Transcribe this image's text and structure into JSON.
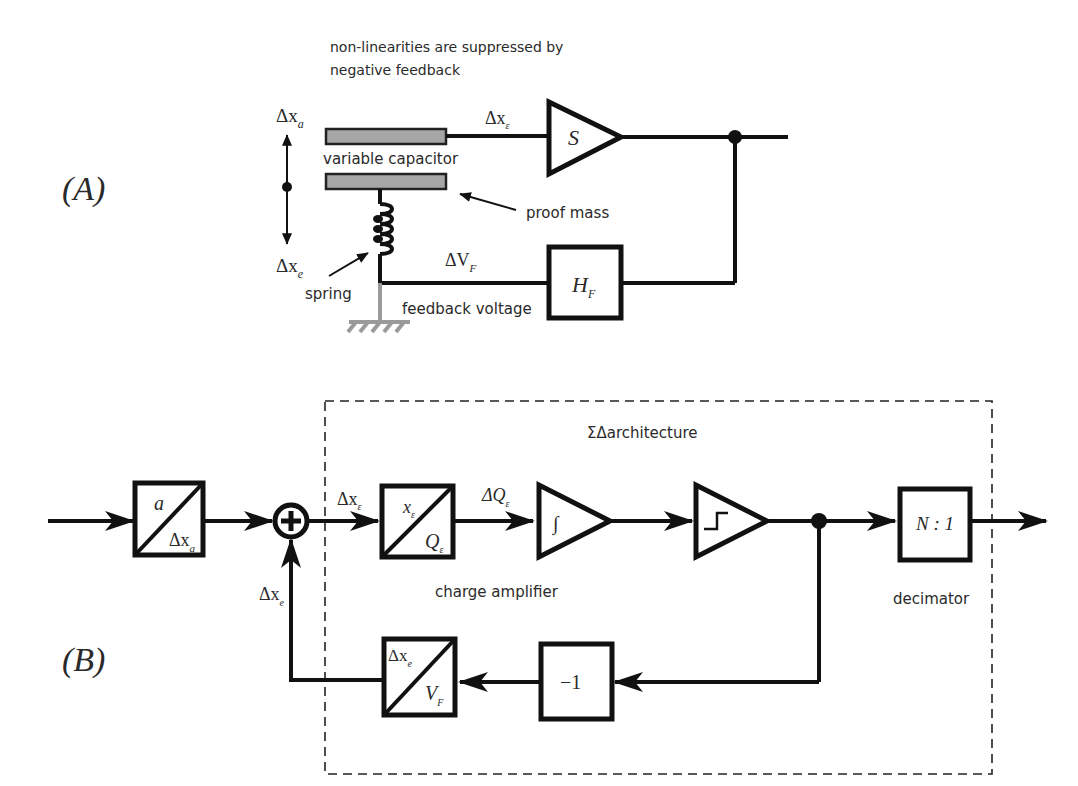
{
  "panel_a": {
    "label": "(A)",
    "note_line1": "non-linearities are suppressed by",
    "note_line2": "negative feedback",
    "dx_a": "Δx",
    "dx_a_sub": "a",
    "dx_e": "Δx",
    "dx_e_sub": "e",
    "dx_eps": "Δx",
    "dx_eps_sub": "ε",
    "capacitor_label": "variable capacitor",
    "proof_mass_label": "proof mass",
    "spring_label": "spring",
    "dv_f": "ΔV",
    "dv_f_sub": "F",
    "feedback_voltage_label": "feedback voltage",
    "sensor_gain": "S",
    "feedback_block": "H",
    "feedback_block_sub": "F"
  },
  "panel_b": {
    "label": "(B)",
    "architecture_title": "ΣΔarchitecture",
    "input_block_top": "a",
    "input_block_bottom": "Δx",
    "input_block_bottom_sub": "a",
    "sum_symbol": "+",
    "dx_eps": "Δx",
    "dx_eps_sub": "ε",
    "charge_block_top": "x",
    "charge_block_top_sub": "ε",
    "charge_block_bottom": "Q",
    "charge_block_bottom_sub": "ε",
    "dq_eps": "ΔQ",
    "dq_eps_sub": "ε",
    "integrator_symbol": "∫",
    "charge_amplifier_label": "charge amplifier",
    "decimator_block": "N : 1",
    "decimator_label": "decimator",
    "inverter_block": "−1",
    "feedback_block_top": "Δx",
    "feedback_block_top_sub": "e",
    "feedback_block_bottom": "V",
    "feedback_block_bottom_sub": "F",
    "dx_e": "Δx",
    "dx_e_sub": "e"
  }
}
